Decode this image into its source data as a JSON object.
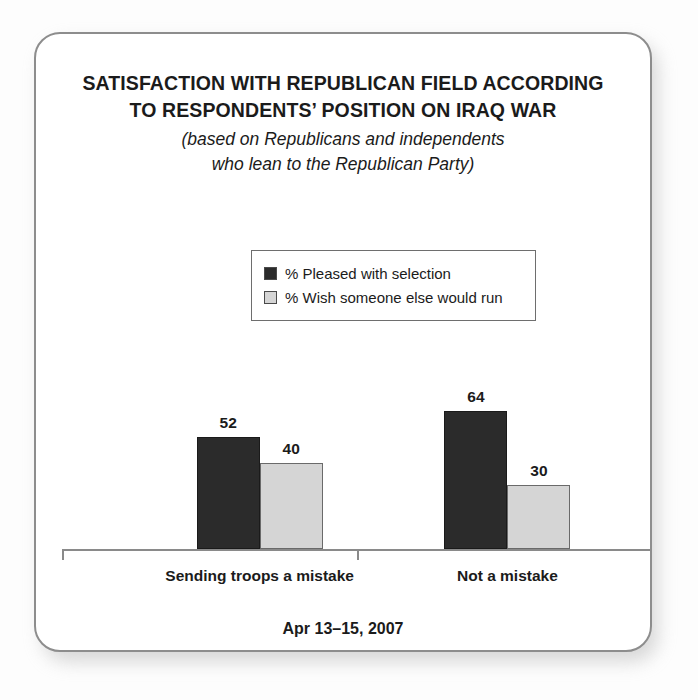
{
  "card": {
    "title_lines": [
      "SATISFACTION WITH REPUBLICAN FIELD ACCORDING",
      "TO RESPONDENTS’ POSITION ON IRAQ WAR"
    ],
    "subtitle_lines": [
      "(based on Republicans and independents",
      "who lean to the Republican Party)"
    ],
    "footer": "Apr 13–15, 2007"
  },
  "colors": {
    "dark_series": "#2b2b2b",
    "light_series": "#d5d5d5",
    "text": "#1b1b1b",
    "card_border": "#8d8d8d",
    "axis": "#8a8a8a"
  },
  "chart_data": {
    "type": "bar",
    "title": "SATISFACTION WITH REPUBLICAN FIELD ACCORDING TO RESPONDENTS’ POSITION ON IRAQ WAR",
    "subtitle": "(based on Republicans and independents who lean to the Republican Party)",
    "categories": [
      "Sending troops a mistake",
      "Not a mistake"
    ],
    "series": [
      {
        "name": "% Pleased with selection",
        "color": "#2b2b2b",
        "values": [
          52,
          64
        ]
      },
      {
        "name": "% Wish someone else would run",
        "color": "#d5d5d5",
        "values": [
          40,
          30
        ]
      }
    ],
    "xlabel": "",
    "ylabel": "",
    "ylim": [
      0,
      100
    ],
    "grid": false,
    "legend_position": "top-center",
    "value_labels": true,
    "annotation": "Apr 13–15, 2007"
  }
}
